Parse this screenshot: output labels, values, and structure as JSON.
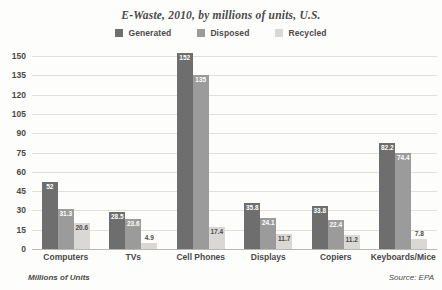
{
  "chart_data": {
    "type": "bar",
    "title": "E-Waste, 2010, by millions of units, U.S.",
    "xlabel": "",
    "ylabel": "Millions of Units",
    "ylim": [
      0,
      150
    ],
    "yticks": [
      150,
      135,
      120,
      105,
      90,
      75,
      60,
      45,
      30,
      15,
      0
    ],
    "grid": true,
    "legend_position": "top-center",
    "categories": [
      "Computers",
      "TVs",
      "Cell Phones",
      "Displays",
      "Copiers",
      "Keyboards/Mice"
    ],
    "series": [
      {
        "name": "Generated",
        "color": "#6e6e6e",
        "values": [
          52,
          28.5,
          152,
          35.8,
          33.8,
          82.2
        ],
        "labels": [
          "52",
          "28.5",
          "152",
          "35.8",
          "33.8",
          "82.2"
        ]
      },
      {
        "name": "Disposed",
        "color": "#9b9b9b",
        "values": [
          31.3,
          23.6,
          135,
          24.1,
          22.4,
          74.4
        ],
        "labels": [
          "31.3",
          "23.6",
          "135",
          "24.1",
          "22.4",
          "74.4"
        ]
      },
      {
        "name": "Recycled",
        "color": "#dad8d4",
        "values": [
          20.6,
          4.9,
          17.4,
          11.7,
          11.2,
          7.8
        ],
        "labels": [
          "20.6",
          "4.9",
          "17.4",
          "11.7",
          "11.2",
          "7.8"
        ]
      }
    ],
    "source_note": "Source: EPA"
  },
  "footer": {
    "axis_note": "Millions of Units",
    "source": "Source: EPA"
  }
}
